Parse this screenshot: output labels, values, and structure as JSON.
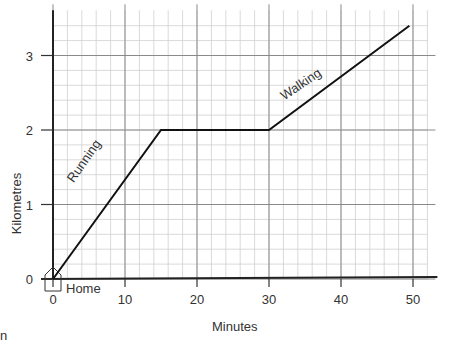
{
  "chart_data": {
    "type": "line",
    "title": "",
    "xlabel": "Minutes",
    "ylabel": "Kilometres",
    "x_ticks": [
      "0",
      "10",
      "20",
      "30",
      "40",
      "50"
    ],
    "y_ticks": [
      "0",
      "1",
      "2",
      "3"
    ],
    "xlim": [
      0,
      52
    ],
    "ylim": [
      0,
      3.5
    ],
    "grid": true,
    "series": [
      {
        "name": "Journey",
        "x": [
          0,
          15,
          30,
          49.5
        ],
        "y": [
          0,
          2,
          2,
          3.4
        ]
      }
    ],
    "annotations": [
      {
        "text": "Running",
        "segment": "0-15 min"
      },
      {
        "text": "Walking",
        "segment": "30-49.5 min"
      },
      {
        "text": "Home",
        "at": "origin"
      }
    ]
  },
  "labels": {
    "ylabel": "Kilometres",
    "xlabel": "Minutes",
    "home": "Home",
    "running": "Running",
    "walking": "Walking",
    "stray": "n"
  }
}
